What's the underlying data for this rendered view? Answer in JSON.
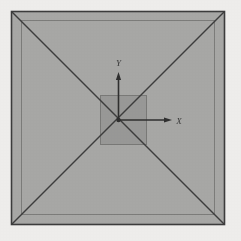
{
  "figure": {
    "kind": "technical-line-drawing",
    "canvas": {
      "width": 241,
      "height": 241
    },
    "colors": {
      "page_background": "#f1f0ee",
      "base_fill": "#a9a9a7",
      "inner_fill": "#9a9a98",
      "line_dark": "#3c3c3c",
      "line_mid": "#6b6b6b",
      "line_light": "#8a8a88",
      "label_color": "#3a3a3a"
    }
  },
  "shapes": {
    "outer_square": {
      "name": "pyramid-base-outline",
      "x": 11.5,
      "y": 11.5,
      "width": 213,
      "height": 213,
      "stroke": "#3c3c3c",
      "stroke_width": 1.6,
      "fill": "#a9a9a7"
    },
    "offset_square": {
      "name": "pyramid-base-inner-offset",
      "x": 21.5,
      "y": 20.5,
      "width": 193,
      "height": 194,
      "stroke": "#7d7d7b",
      "stroke_width": 1.0,
      "fill": "none"
    },
    "apex_square": {
      "name": "pyramid-apex-platform",
      "x": 100.5,
      "y": 95.5,
      "width": 46,
      "height": 49,
      "stroke": "#7a7a78",
      "stroke_width": 1.0,
      "fill": "#9a9a98"
    },
    "diagonals": [
      {
        "name": "diagonal-tl-br",
        "x1": 12,
        "y1": 12,
        "x2": 224,
        "y2": 224
      },
      {
        "name": "diagonal-tr-bl",
        "x1": 224,
        "y1": 12,
        "x2": 12,
        "y2": 224
      }
    ],
    "diagonal_stroke": "#3c3c3c",
    "diagonal_stroke_width": 1.5
  },
  "axes": {
    "origin": {
      "x": 118.5,
      "y": 120.0,
      "label": "O"
    },
    "stroke": "#2f2f2f",
    "stroke_width": 1.6,
    "x_axis": {
      "name": "x-axis",
      "label": "X",
      "from": {
        "x": 118.5,
        "y": 120.0
      },
      "to": {
        "x": 172.0,
        "y": 120.0
      },
      "label_pos": {
        "x": 179.0,
        "y": 123.5
      },
      "direction": "right"
    },
    "y_axis": {
      "name": "y-axis",
      "label": "Y",
      "from": {
        "x": 118.5,
        "y": 120.0
      },
      "to": {
        "x": 118.5,
        "y": 72.0
      },
      "label_pos": {
        "x": 118.5,
        "y": 66.0
      },
      "direction": "up"
    },
    "arrowhead": {
      "length": 8,
      "half_width": 2.6
    }
  }
}
